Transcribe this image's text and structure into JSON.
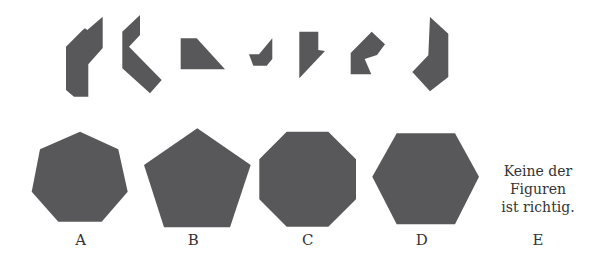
{
  "colors": {
    "shape_fill": "#58585a",
    "text": "#333333",
    "background": "#ffffff"
  },
  "pieces": [
    {
      "id": "piece-1",
      "points": "102.7,16.7 102.7,48 88.3,64.3 88.3,96.7 74,96.7 66,90 66,46.7 82.7,30 85,28.3 87.3,30"
    },
    {
      "id": "piece-2",
      "points": "140,15 140,35 129,46.7 161.7,80 150,93.3 122.3,68.3 122.3,31.7"
    },
    {
      "id": "piece-3",
      "points": "180.7,38.3 196.7,38.3 225,69.3 180.7,69.3"
    },
    {
      "id": "piece-4",
      "points": "272.3,38.3 272.3,59 266.7,65.7 253.3,65.7 249,54.3 259,54.3"
    },
    {
      "id": "piece-5",
      "points": "299.3,31.7 318.3,31.7 318.3,50 325,51 299.3,78.3"
    },
    {
      "id": "piece-6",
      "points": "371.7,31.7 385,44.3 377,55 364.7,59 371.3,74.3 350.7,74.3 350.7,53"
    },
    {
      "id": "piece-7",
      "points": "430,17 448.3,33.7 448.3,77 430,91.3 412.3,72 428.3,55.3"
    }
  ],
  "options": [
    {
      "label": "A",
      "shape": "heptagon",
      "points": "80,131.7 118.3,149.3 127.7,191.7 101.7,221.7 58.3,221.7 31.7,191.7 40,149.3",
      "label_x": 80.7
    },
    {
      "label": "B",
      "shape": "pentagon",
      "points": "197.3,128.3 250.7,165 230,227.3 164,227.3 144,165",
      "label_x": 193.3
    },
    {
      "label": "C",
      "shape": "octagon",
      "points": "286.7,131.7 328.3,131.7 356,159.3 356,199.3 328.3,226.7 286.7,226.7 259.3,199.3 259.3,159.3",
      "label_x": 307.7
    },
    {
      "label": "D",
      "shape": "hexagon",
      "points": "396.7,133.3 455,133.3 479,176.7 455,224.3 396.7,224.3 372.3,176.7",
      "label_x": 421.7
    }
  ],
  "option_e": {
    "label": "E",
    "lines": [
      "Keine der",
      "Figuren",
      "ist richtig."
    ]
  }
}
